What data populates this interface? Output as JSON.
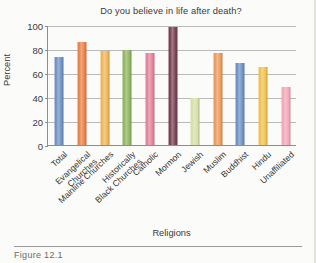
{
  "figure": {
    "caption": "Figure 12.1",
    "background_color": "#fbfbf9"
  },
  "chart_data": {
    "type": "bar",
    "title": "Do you believe in life after death?",
    "xlabel": "Religions",
    "ylabel": "Percent",
    "ylim": [
      0,
      100
    ],
    "yticks": [
      0,
      20,
      40,
      60,
      80,
      100
    ],
    "grid": true,
    "legend": "none",
    "categories": [
      "Total",
      "Evangelical Churches",
      "Mainline Churches",
      "Historically Black Churches",
      "Catholic",
      "Mormon",
      "Jewish",
      "Muslim",
      "Buddhist",
      "Hindu",
      "Unaffiliated"
    ],
    "category_lines": [
      [
        "Total"
      ],
      [
        "Evangelical",
        "Churches"
      ],
      [
        "Mainline Churches"
      ],
      [
        "Historically",
        "Black Churches"
      ],
      [
        "Catholic"
      ],
      [
        "Mormon"
      ],
      [
        "Jewish"
      ],
      [
        "Muslim"
      ],
      [
        "Buddhist"
      ],
      [
        "Hindu"
      ],
      [
        "Unaffiliated"
      ]
    ],
    "values": [
      73,
      86,
      78,
      79,
      77,
      98,
      39,
      77,
      68,
      65,
      48
    ],
    "colors": [
      "#6f92c4",
      "#e8834a",
      "#f0b556",
      "#8fb661",
      "#e3849a",
      "#7a4355",
      "#d5e0a6",
      "#eb9b5e",
      "#6f92c4",
      "#f0c24e",
      "#f2a8b8"
    ]
  }
}
